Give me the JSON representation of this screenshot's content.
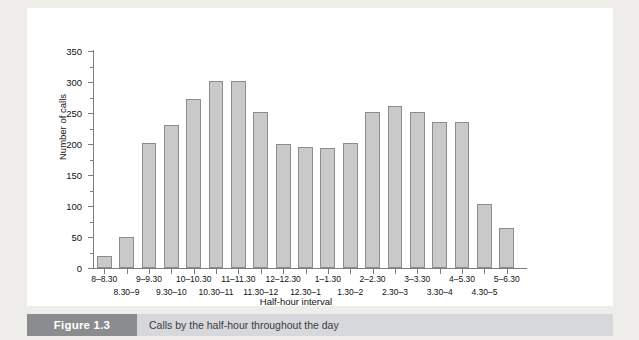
{
  "figure": {
    "number_label": "Figure 1.3",
    "caption": "Calls by the half-hour throughout the day"
  },
  "chart_data": {
    "type": "bar",
    "title": "",
    "xlabel": "Half-hour interval",
    "ylabel": "Number of calls",
    "ylim": [
      0,
      350
    ],
    "yticks": [
      0,
      50,
      100,
      150,
      200,
      250,
      300,
      350
    ],
    "ytick_labels": [
      "0",
      "50",
      "100",
      "150",
      "200",
      "250",
      "300",
      "350"
    ],
    "y_minor_ticks": [
      25,
      75,
      125,
      175,
      225,
      275,
      325
    ],
    "grid": false,
    "legend": null,
    "categories": [
      "8–8.30",
      "8.30–9",
      "9–9.30",
      "9.30–10",
      "10–10.30",
      "10.30–11",
      "11–11.30",
      "11.30–12",
      "12–12.30",
      "12.30–1",
      "1–1.30",
      "1.30–2",
      "2–2.30",
      "2.30–3",
      "3–3.30",
      "3.30–4",
      "4–5.30",
      "4.30–5",
      "5–6.30"
    ],
    "values": [
      20,
      50,
      201,
      231,
      272,
      301,
      301,
      251,
      200,
      195,
      193,
      202,
      251,
      262,
      251,
      235,
      235,
      104,
      64
    ]
  }
}
